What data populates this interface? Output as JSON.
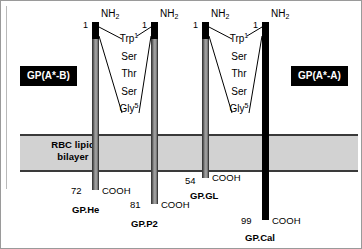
{
  "figure": {
    "membrane_label_line1": "RBC lipid",
    "membrane_label_line2": "bilayer",
    "left_chip": "GP(A*-B)",
    "right_chip": "GP(A*-A)",
    "nh2": "NH",
    "nh2_sub": "2",
    "start_number": "1",
    "cooh": "COOH"
  },
  "sequences": [
    {
      "id": "left-sequence",
      "residues": [
        {
          "name": "Trp",
          "sup": "1"
        },
        {
          "name": "Ser",
          "sup": ""
        },
        {
          "name": "Thr",
          "sup": ""
        },
        {
          "name": "Ser",
          "sup": ""
        },
        {
          "name": "Gly",
          "sup": "5"
        }
      ]
    },
    {
      "id": "right-sequence",
      "residues": [
        {
          "name": "Trp",
          "sup": "1"
        },
        {
          "name": "Ser",
          "sup": ""
        },
        {
          "name": "Thr",
          "sup": ""
        },
        {
          "name": "Ser",
          "sup": ""
        },
        {
          "name": "Gly",
          "sup": "5"
        }
      ]
    }
  ],
  "proteins": [
    {
      "name": "GP.He",
      "c_term_number": "72",
      "cooh": "COOH",
      "n_term_number": "1",
      "nh2": "NH",
      "nh2_sub": "2",
      "style": "gray"
    },
    {
      "name": "GP.P2",
      "c_term_number": "81",
      "cooh": "COOH",
      "n_term_number": "1",
      "nh2": "NH",
      "nh2_sub": "2",
      "style": "gray"
    },
    {
      "name": "GP.GL",
      "c_term_number": "54",
      "cooh": "COOH",
      "n_term_number": "1",
      "nh2": "NH",
      "nh2_sub": "2",
      "style": "gray"
    },
    {
      "name": "GP.Cal",
      "c_term_number": "99",
      "cooh": "COOH",
      "n_term_number": "1",
      "nh2": "NH",
      "nh2_sub": "2",
      "style": "black"
    }
  ],
  "colors": {
    "membrane_fill": "#d2d2d2",
    "membrane_border": "#3a3a3a",
    "bar_black": "#000000",
    "bar_gray": "#8f8f8f",
    "chip_bg": "#000000",
    "chip_text": "#ffffff"
  }
}
